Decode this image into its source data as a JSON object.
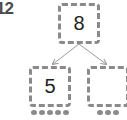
{
  "problem": {
    "number": "12"
  },
  "number_bond": {
    "whole": "8",
    "part_left": "5",
    "part_right": "",
    "dots_left_count": 5,
    "dots_right_count": 3
  },
  "colors": {
    "box_border": "#8a8a8a",
    "arrow": "#9a9a9a",
    "dot": "#8a8a8a",
    "text": "#222222",
    "problem_number": "#4a4a4a"
  }
}
